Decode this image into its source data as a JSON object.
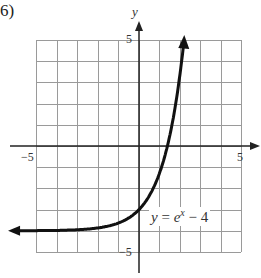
{
  "problem_number": "6)",
  "chart_data": {
    "type": "line",
    "title": "",
    "function": "y = e^x - 4",
    "xlabel": "x",
    "ylabel": "y",
    "xlim": [
      -5,
      5
    ],
    "ylim": [
      -5,
      5
    ],
    "grid": true,
    "grid_step": 1,
    "tick_labels": {
      "x": [
        "-5",
        "5"
      ],
      "y": [
        "5",
        "-5"
      ]
    },
    "annotation": "y = e^x − 4",
    "horizontal_asymptote": -4,
    "series": [
      {
        "name": "y = e^x - 4",
        "x": [
          -5.5,
          -4,
          -3,
          -2,
          -1,
          0,
          0.5,
          1,
          1.5,
          2,
          2.2
        ],
        "values": [
          -3.996,
          -3.98,
          -3.95,
          -3.86,
          -3.63,
          -3,
          -2.35,
          -1.28,
          0.48,
          3.39,
          5.03
        ]
      }
    ]
  },
  "labels": {
    "y_axis": "y",
    "tick_y_top": "5",
    "tick_y_bottom": "−5",
    "tick_x_left": "−5",
    "tick_x_right": "5",
    "eq_y": "y",
    "eq_eq": " = ",
    "eq_e": "e",
    "eq_exp": "x",
    "eq_rest": " − 4"
  }
}
